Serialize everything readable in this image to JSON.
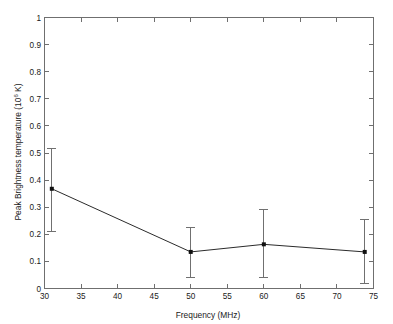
{
  "figure": {
    "background_color": "#ffffff",
    "frame_color": "#6f6f6f",
    "line_color": "#2b2b2b",
    "marker_color": "#101010",
    "errorbar_color": "#707070"
  },
  "axes": {
    "x_title": "Frequency (MHz)",
    "y_title_main": "Peak Brightness temperature (10",
    "y_title_exponent": "6",
    "y_title_tail": " K)",
    "x_ticks": [
      "30",
      "35",
      "40",
      "45",
      "50",
      "55",
      "60",
      "65",
      "70",
      "75"
    ],
    "y_ticks": [
      "0",
      "0.1",
      "0.2",
      "0.3",
      "0.4",
      "0.5",
      "0.6",
      "0.7",
      "0.8",
      "0.9",
      "1"
    ]
  },
  "chart_data": {
    "type": "line",
    "title": "",
    "xlabel": "Frequency (MHz)",
    "ylabel": "Peak Brightness temperature (10^6 K)",
    "xlim": [
      30,
      75
    ],
    "ylim": [
      0,
      1
    ],
    "xticks": [
      30,
      35,
      40,
      45,
      50,
      55,
      60,
      65,
      70,
      75
    ],
    "yticks": [
      0,
      0.1,
      0.2,
      0.3,
      0.4,
      0.5,
      0.6,
      0.7,
      0.8,
      0.9,
      1
    ],
    "grid": false,
    "legend": null,
    "marker": "square",
    "errorbars": true,
    "x": [
      31.0,
      50.0,
      60.0,
      73.8
    ],
    "y": [
      0.368,
      0.135,
      0.163,
      0.135
    ],
    "y_err_lower": [
      0.158,
      0.095,
      0.123,
      0.115
    ],
    "y_err_upper": [
      0.147,
      0.09,
      0.127,
      0.12
    ],
    "y_err_low_abs": [
      0.21,
      0.04,
      0.04,
      0.02
    ],
    "y_err_high_abs": [
      0.515,
      0.225,
      0.29,
      0.255
    ],
    "series": [
      {
        "name": "Peak Brightness temperature",
        "points": [
          {
            "x": 31.0,
            "y": 0.368,
            "low": 0.21,
            "high": 0.515
          },
          {
            "x": 50.0,
            "y": 0.135,
            "low": 0.04,
            "high": 0.225
          },
          {
            "x": 60.0,
            "y": 0.163,
            "low": 0.04,
            "high": 0.29
          },
          {
            "x": 73.8,
            "y": 0.135,
            "low": 0.02,
            "high": 0.255
          }
        ]
      }
    ]
  }
}
